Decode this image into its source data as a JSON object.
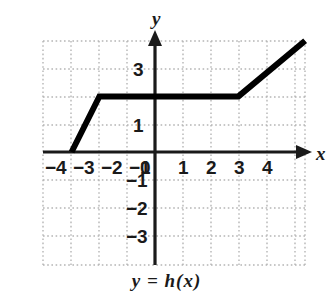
{
  "caption": "y = h(x)",
  "axis_names": {
    "x": "x",
    "y": "y"
  },
  "colors": {
    "curve": "#000000",
    "axis": "#1a1a1a",
    "grid": "#b5b5b5",
    "background": "#ffffff",
    "label": "#1a1a1a"
  },
  "x_tick_labels": [
    {
      "text": "−4",
      "value": -4
    },
    {
      "text": "−3",
      "value": -3
    },
    {
      "text": "−2",
      "value": -2
    },
    {
      "text": "−1",
      "value": -1
    },
    {
      "text": "0",
      "value": 0
    },
    {
      "text": "1",
      "value": 1
    },
    {
      "text": "2",
      "value": 2
    },
    {
      "text": "3",
      "value": 3
    },
    {
      "text": "4",
      "value": 4
    }
  ],
  "y_tick_labels": [
    {
      "text": "3",
      "value": 3
    },
    {
      "text": "1",
      "value": 1
    },
    {
      "text": "−1",
      "value": -1
    },
    {
      "text": "−2",
      "value": -2
    },
    {
      "text": "−3",
      "value": -3
    }
  ],
  "chart_data": {
    "type": "line",
    "title": "",
    "subtitle": "",
    "xlabel": "x",
    "ylabel": "y",
    "legend": [],
    "legend_position": "none",
    "grid": true,
    "grid_style": "dotted",
    "xlim": [
      -4.5,
      5.4
    ],
    "ylim": [
      -4.1,
      4.0
    ],
    "xticks": [
      -4,
      -3,
      -2,
      -1,
      0,
      1,
      2,
      3,
      4
    ],
    "yticks": [
      3,
      1,
      -1,
      -2,
      -3
    ],
    "annotations": [
      "y = h(x)"
    ],
    "series": [
      {
        "name": "h(x)",
        "points": [
          {
            "x": -3,
            "y": 0
          },
          {
            "x": -2,
            "y": 2
          },
          {
            "x": 3,
            "y": 2
          },
          {
            "x": 5.4,
            "y": 4
          }
        ],
        "description": "Piecewise linear: rises from (-3,0) to (-2,2), constant at y=2 from x=-2 to x=3, then rises with slope 1 beyond x=3"
      }
    ]
  }
}
